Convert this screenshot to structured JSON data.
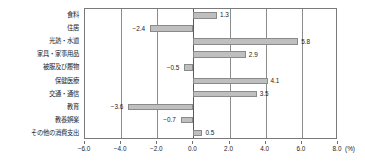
{
  "chart_data": {
    "type": "bar",
    "orientation": "horizontal",
    "title": "",
    "subtitle": "",
    "xlabel": "(%)",
    "ylabel": "",
    "unit": "(%)",
    "xlim": [
      -6.0,
      8.0
    ],
    "xticks": [
      "-6.0",
      "-4.0",
      "-2.0",
      "0.0",
      "2.0",
      "4.0",
      "6.0",
      "8.0"
    ],
    "xtick_values": [
      -6.0,
      -4.0,
      -2.0,
      0.0,
      2.0,
      4.0,
      6.0,
      8.0
    ],
    "grid": true,
    "legend": null,
    "bar_color": "#bfbfbf",
    "bar_border_color": "#8a8a8a",
    "categories": [
      "食料",
      "住居",
      "光熱・水道",
      "家具・家事用品",
      "被服及び履物",
      "保健医療",
      "交通・通信",
      "教育",
      "教養娯楽",
      "その他の消費支出"
    ],
    "values": [
      1.3,
      -2.4,
      5.8,
      2.9,
      -0.5,
      4.1,
      3.5,
      -3.6,
      -0.7,
      0.5
    ],
    "data_labels": [
      "1.3",
      "-2.4",
      "5.8",
      "2.9",
      "-0.5",
      "4.1",
      "3.5",
      "-3.6",
      "-0.7",
      "0.5"
    ]
  }
}
